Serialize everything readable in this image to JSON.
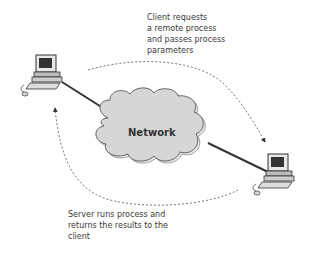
{
  "diagram": {
    "network_label": "Network",
    "request_caption": "Client requests\na remote process\nand passes process\nparameters",
    "return_caption": "Server runs process and\nreturns the results to the\nclient",
    "nodes": [
      {
        "id": "client",
        "icon": "desktop-computer-icon"
      },
      {
        "id": "network",
        "icon": "cloud-icon"
      },
      {
        "id": "server",
        "icon": "desktop-computer-icon"
      }
    ],
    "edges": [
      {
        "from": "client",
        "to": "network",
        "style": "solid"
      },
      {
        "from": "network",
        "to": "server",
        "style": "solid"
      },
      {
        "from": "client",
        "to": "server",
        "style": "dashed-arrow",
        "label": "request"
      },
      {
        "from": "server",
        "to": "client",
        "style": "dashed-arrow",
        "label": "return"
      }
    ],
    "colors": {
      "cloud_fill": "#d6d6d6",
      "cloud_stroke": "#555555",
      "line": "#333333",
      "text": "#3a3a3a"
    }
  }
}
